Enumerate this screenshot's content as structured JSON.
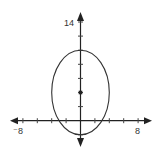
{
  "chart_data": {
    "type": "line",
    "title": "",
    "xlabel": "",
    "ylabel": "",
    "xlim": [
      -8,
      8
    ],
    "ylim": [
      -2,
      14
    ],
    "grid": false,
    "x_tick_step": 2,
    "y_tick_step": 2,
    "tick_labels": {
      "x_min": "⁻8",
      "x_max": "8",
      "y_max": "14"
    },
    "series": [
      {
        "name": "ellipse",
        "shape": "ellipse",
        "center": [
          0,
          4
        ],
        "semi_axis_x": 4,
        "semi_axis_y": 6,
        "equation": "x^2/16 + (y-4)^2/36 = 1"
      }
    ],
    "points": [
      {
        "name": "center",
        "x": 0,
        "y": 4
      }
    ],
    "colors": {
      "axis": "#222222",
      "curve": "#333333",
      "text": "#333333"
    }
  }
}
